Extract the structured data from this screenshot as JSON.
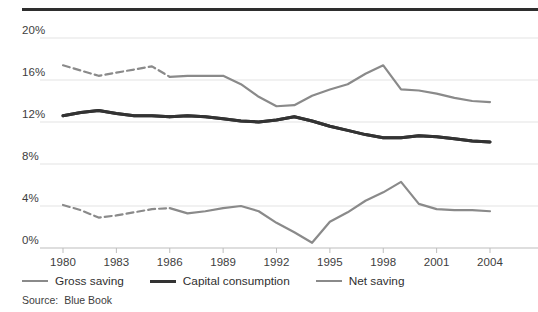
{
  "chart_data": {
    "type": "line",
    "title": "",
    "subtitle": "",
    "xlabel": "",
    "ylabel": "",
    "xlim": [
      1980,
      2004
    ],
    "ylim": [
      0,
      20
    ],
    "grid": true,
    "grid_axis": "y",
    "legend_position": "bottom-left",
    "y_ticks": [
      0,
      4,
      8,
      12,
      16,
      20
    ],
    "y_tick_labels": [
      "0%",
      "4%",
      "8%",
      "12%",
      "16%",
      "20%"
    ],
    "x_ticks": [
      1980,
      1983,
      1986,
      1989,
      1992,
      1995,
      1998,
      2001,
      2004
    ],
    "x_tick_labels": [
      "1980",
      "1983",
      "1986",
      "1989",
      "1992",
      "1995",
      "1998",
      "2001",
      "2004"
    ],
    "x": [
      1980,
      1981,
      1982,
      1983,
      1984,
      1985,
      1986,
      1987,
      1988,
      1989,
      1990,
      1991,
      1992,
      1993,
      1994,
      1995,
      1996,
      1997,
      1998,
      1999,
      2000,
      2001,
      2002,
      2003,
      2004
    ],
    "dashed_until": 1986,
    "series": [
      {
        "name": "Gross saving",
        "color": "#8a8a8a",
        "width": 2.2,
        "values": [
          17.4,
          16.9,
          16.4,
          16.7,
          17.0,
          17.3,
          16.3,
          16.4,
          16.4,
          16.4,
          15.6,
          14.4,
          13.5,
          13.6,
          14.5,
          15.1,
          15.6,
          16.6,
          17.4,
          15.1,
          15.0,
          14.7,
          14.3,
          14.0,
          13.9
        ]
      },
      {
        "name": "Capital consumption",
        "color": "#333333",
        "width": 3.0,
        "values": [
          12.6,
          12.9,
          13.1,
          12.8,
          12.6,
          12.6,
          12.5,
          12.6,
          12.5,
          12.3,
          12.1,
          12.0,
          12.2,
          12.5,
          12.1,
          11.6,
          11.2,
          10.8,
          10.5,
          10.5,
          10.7,
          10.6,
          10.4,
          10.2,
          10.1
        ]
      },
      {
        "name": "Net saving",
        "color": "#8a8a8a",
        "width": 2.2,
        "values": [
          4.1,
          3.6,
          2.9,
          3.1,
          3.4,
          3.7,
          3.8,
          3.3,
          3.5,
          3.8,
          4.0,
          3.5,
          2.4,
          1.5,
          0.5,
          2.5,
          3.4,
          4.5,
          5.3,
          6.3,
          4.2,
          3.7,
          3.6,
          3.6,
          3.5
        ]
      }
    ]
  },
  "legend": {
    "items": [
      {
        "label": "Gross saving",
        "style": "thin"
      },
      {
        "label": "Capital consumption",
        "style": "thick"
      },
      {
        "label": "Net saving",
        "style": "thin"
      }
    ]
  },
  "source": {
    "label": "Source:",
    "value": "Blue Book"
  },
  "colors": {
    "grid": "#e3e3e3",
    "axis": "#bdbdbd",
    "rule": "#2e2e2e",
    "text": "#3d3d3d",
    "gross": "#8a8a8a",
    "capital": "#333333",
    "net": "#8a8a8a"
  }
}
